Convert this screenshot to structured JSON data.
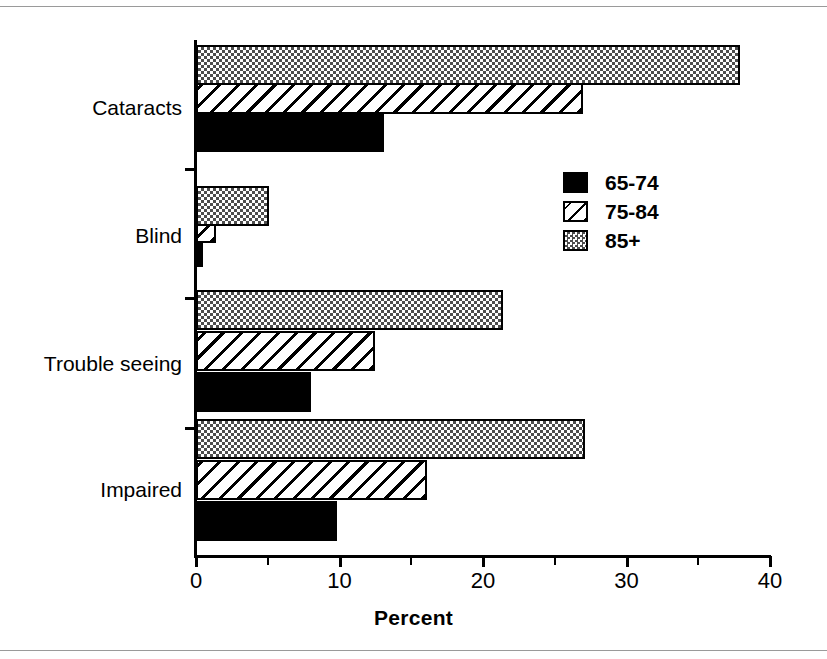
{
  "chart_data": {
    "type": "bar",
    "orientation": "horizontal",
    "title": "",
    "xlabel": "Percent",
    "ylabel": "",
    "categories": [
      "Impaired",
      "Trouble seeing",
      "Blind",
      "Cataracts"
    ],
    "series": [
      {
        "name": "65-74",
        "pattern": "solid-black",
        "values": [
          9.8,
          8.0,
          0.5,
          13.1
        ]
      },
      {
        "name": "75-84",
        "pattern": "diagonal-hatch",
        "values": [
          16.1,
          12.5,
          1.4,
          27.0
        ]
      },
      {
        "name": "85+",
        "pattern": "checker-grey",
        "values": [
          27.1,
          21.4,
          5.1,
          37.9
        ]
      }
    ],
    "xlim": [
      0,
      40
    ],
    "xticks": [
      0,
      10,
      20,
      30,
      40
    ],
    "xtick_labels": [
      "0",
      "10",
      "20",
      "30",
      "40"
    ],
    "xminor_ticks": [
      5,
      15,
      25,
      35
    ],
    "grid": false,
    "legend_position": "upper-right",
    "legend_entries": [
      "65-74",
      "75-84",
      "85+"
    ]
  },
  "axis": {
    "x_title": "Percent",
    "tick_labels": [
      "0",
      "10",
      "20",
      "30",
      "40"
    ]
  },
  "categories": {
    "impaired": "Impaired",
    "trouble_seeing": "Trouble seeing",
    "blind": "Blind",
    "cataracts": "Cataracts"
  },
  "legend": {
    "items": [
      {
        "label": "65-74"
      },
      {
        "label": "75-84"
      },
      {
        "label": "85+"
      }
    ]
  }
}
